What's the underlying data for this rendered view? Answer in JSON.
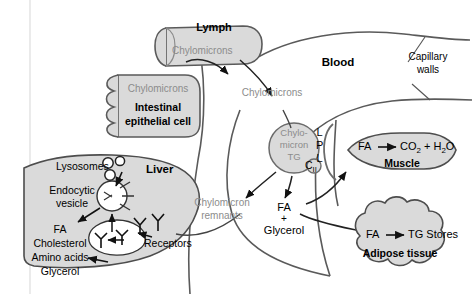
{
  "diagram": {
    "colors": {
      "organ_fill": "#d9d9d9",
      "organ_stroke": "#595959",
      "gray_text": "#8c8c8c",
      "black_text": "#000000",
      "background": "#ffffff"
    }
  },
  "compartments": {
    "lymph": {
      "label": "Lymph",
      "content": "Chylomicrons"
    },
    "intestine": {
      "label_line1": "Intestinal",
      "label_line2": "epithelial cell",
      "content": "Chylomicrons"
    },
    "blood": {
      "label": "Blood"
    },
    "capillary": {
      "label_line1": "Capillary",
      "label_line2": "walls"
    },
    "muscle": {
      "label": "Muscle",
      "substrate": "FA",
      "products_co2": "CO",
      "products_co2_sub": "2",
      "plus": "+",
      "products_h2o": "H",
      "products_h2o_sub": "2",
      "products_h2o_tail": "O"
    },
    "adipose": {
      "label": "Adipose tissue",
      "substrate": "FA",
      "product": "TG Stores"
    },
    "liver": {
      "label": "Liver",
      "lysosomes": "Lysosomes",
      "vesicle_line1": "Endocytic",
      "vesicle_line2": "vesicle",
      "receptors": "Receptors",
      "products": [
        "FA",
        "Cholesterol",
        "Amino acids",
        "Glycerol"
      ]
    }
  },
  "particles": {
    "chylomicron_core": {
      "line1": "Chylo-",
      "line2": "micron",
      "line3": "TG",
      "apolipoprotein": "C",
      "apolipoprotein_sub": "II"
    },
    "lpl": {
      "letters": [
        "L",
        "P",
        "L"
      ]
    },
    "blood_chylomicrons": "Chylomicrons",
    "remnants_line1": "Chylomicron",
    "remnants_line2": "remnants",
    "lipolysis_fa": "FA",
    "lipolysis_plus": "+",
    "lipolysis_glycerol": "Glycerol"
  }
}
